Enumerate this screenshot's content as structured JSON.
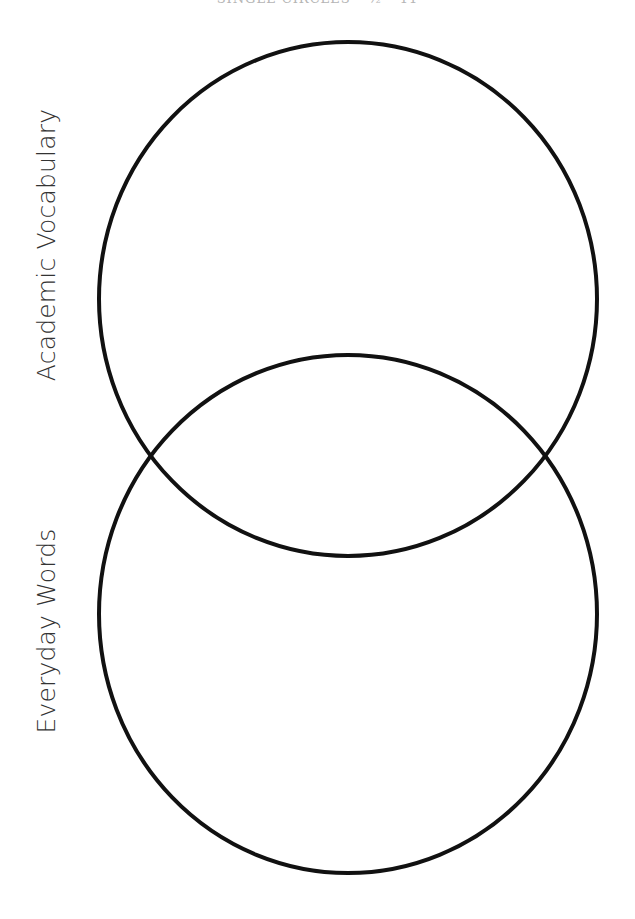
{
  "header": {
    "caption": "SINGLE CIRCLES – ½ – 11"
  },
  "diagram": {
    "type": "venn",
    "stroke_color": "#111111",
    "background": "#ffffff",
    "circles": [
      {
        "name": "academic-vocabulary",
        "label": "Academic Vocabulary",
        "cx": 348,
        "cy": 299,
        "rx": 249,
        "ry": 257
      },
      {
        "name": "everyday-words",
        "label": "Everyday Words",
        "cx": 348,
        "cy": 614,
        "rx": 249,
        "ry": 259
      }
    ]
  },
  "labels": {
    "top": "Academic Vocabulary",
    "bottom": "Everyday Words"
  }
}
